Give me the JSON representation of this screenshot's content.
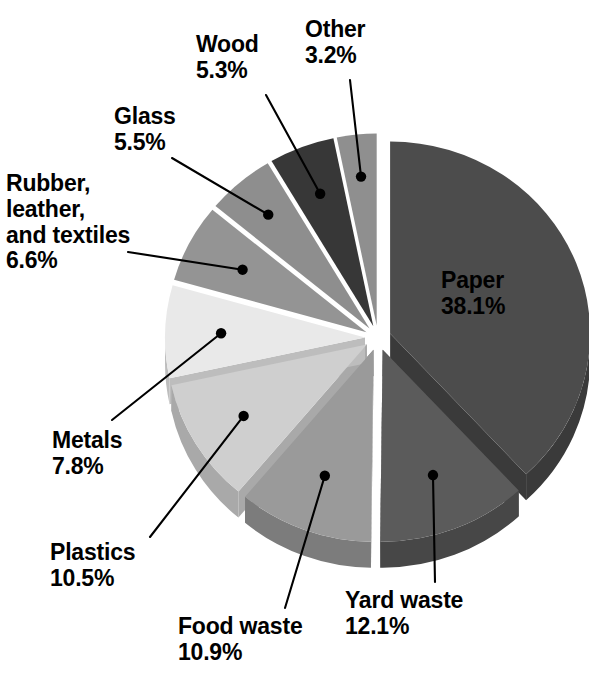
{
  "chart_data": {
    "type": "pie",
    "title": "",
    "subtitle": "",
    "xlabel": "",
    "ylabel": "",
    "units": "percent",
    "exploded": true,
    "style": "3d-exploded-grayscale",
    "legend_position": "none-callout-labels",
    "start_angle_deg": 0,
    "direction": "clockwise",
    "categories": [
      "Paper",
      "Yard waste",
      "Food waste",
      "Plastics",
      "Metals",
      "Rubber, leather, and textiles",
      "Glass",
      "Wood",
      "Other"
    ],
    "values": [
      38.1,
      12.1,
      10.9,
      10.5,
      7.8,
      6.6,
      5.5,
      5.3,
      3.2
    ],
    "value_labels": [
      "38.1%",
      "12.1%",
      "10.9%",
      "10.5%",
      "7.8%",
      "6.6%",
      "5.5%",
      "5.3%",
      "3.2%"
    ],
    "total": 100.0,
    "slices": [
      {
        "name": "Paper",
        "label": "Paper",
        "value": 38.1,
        "value_label": "38.1%",
        "color": "#4c4c4c",
        "side_color": "#3a3a3a",
        "label_placement": "inside"
      },
      {
        "name": "Yard waste",
        "label": "Yard waste",
        "value": 12.1,
        "value_label": "12.1%",
        "color": "#5b5b5b",
        "side_color": "#474747",
        "label_placement": "callout-bottom-right"
      },
      {
        "name": "Food waste",
        "label": "Food waste",
        "value": 10.9,
        "value_label": "10.9%",
        "color": "#9a9a9a",
        "side_color": "#7c7c7c",
        "label_placement": "callout-bottom"
      },
      {
        "name": "Plastics",
        "label": "Plastics",
        "value": 10.5,
        "value_label": "10.5%",
        "color": "#cfcfcf",
        "side_color": "#a9a9a9",
        "label_placement": "callout-bottom-left"
      },
      {
        "name": "Metals",
        "label": "Metals",
        "value": 7.8,
        "value_label": "7.8%",
        "color": "#e9e9e9",
        "side_color": "#bdbdbd",
        "label_placement": "callout-left"
      },
      {
        "name": "Rubber, leather, and textiles",
        "label": "Rubber,\nleather,\nand textiles",
        "value": 6.6,
        "value_label": "6.6%",
        "color": "#949494",
        "side_color": "#767676",
        "label_placement": "callout-upper-left"
      },
      {
        "name": "Glass",
        "label": "Glass",
        "value": 5.5,
        "value_label": "5.5%",
        "color": "#8e8e8e",
        "side_color": "#717171",
        "label_placement": "callout-top-left"
      },
      {
        "name": "Wood",
        "label": "Wood",
        "value": 5.3,
        "value_label": "5.3%",
        "color": "#373737",
        "side_color": "#2b2b2b",
        "label_placement": "callout-top"
      },
      {
        "name": "Other",
        "label": "Other",
        "value": 3.2,
        "value_label": "3.2%",
        "color": "#8f8f8f",
        "side_color": "#737373",
        "label_placement": "callout-top-right"
      }
    ],
    "background_color": "#ffffff",
    "text_color": "#000000",
    "leader_line_color": "#000000"
  },
  "labels": {
    "wood": {
      "text": "Wood\n5.3%"
    },
    "other": {
      "text": "Other\n3.2%"
    },
    "glass": {
      "text": "Glass\n5.5%"
    },
    "rubber": {
      "text": "Rubber,\nleather,\nand textiles\n6.6%"
    },
    "metals": {
      "text": "Metals\n7.8%"
    },
    "plastics": {
      "text": "Plastics\n10.5%"
    },
    "food": {
      "text": "Food waste\n10.9%"
    },
    "yard": {
      "text": "Yard waste\n12.1%"
    },
    "paper": {
      "text": "Paper\n38.1%"
    }
  }
}
